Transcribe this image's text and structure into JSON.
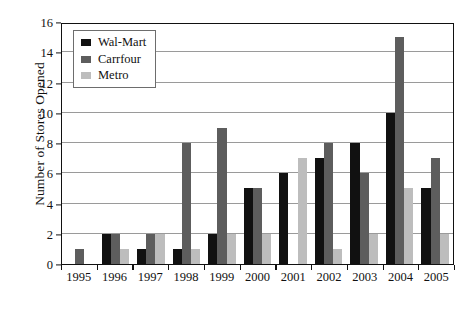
{
  "chart_data": {
    "type": "bar",
    "title": "",
    "xlabel": "",
    "ylabel": "Number of Stores Opened",
    "ylim": [
      0,
      16
    ],
    "ytick_step": 2,
    "yticks": [
      0,
      2,
      4,
      6,
      8,
      10,
      12,
      14,
      16
    ],
    "grid": true,
    "legend_position": "top-left",
    "categories": [
      "1995",
      "1996",
      "1997",
      "1998",
      "1999",
      "2000",
      "2001",
      "2002",
      "2003",
      "2004",
      "2005"
    ],
    "series": [
      {
        "name": "Wal-Mart",
        "color": "#111111",
        "values": [
          0,
          2,
          1,
          1,
          2,
          5,
          6,
          7,
          8,
          10,
          5
        ]
      },
      {
        "name": "Carrfour",
        "color": "#5d5d5d",
        "values": [
          1,
          2,
          2,
          8,
          9,
          5,
          0,
          8,
          6,
          15,
          7
        ]
      },
      {
        "name": "Metro",
        "color": "#bdbdbd",
        "values": [
          0,
          1,
          2,
          1,
          2,
          2,
          7,
          1,
          2,
          5,
          2
        ]
      }
    ]
  },
  "legend": {
    "items": [
      {
        "label": "Wal-Mart"
      },
      {
        "label": "Carrfour"
      },
      {
        "label": "Metro"
      }
    ]
  }
}
